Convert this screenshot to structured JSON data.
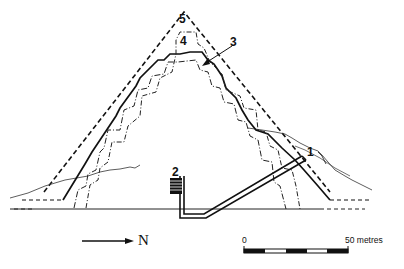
{
  "diagram": {
    "title": "",
    "labels": [
      {
        "id": "1",
        "text": "1",
        "x": 306,
        "y": 146
      },
      {
        "id": "2",
        "text": "2",
        "x": 170,
        "y": 166
      },
      {
        "id": "3",
        "text": "3",
        "x": 228,
        "y": 36
      },
      {
        "id": "4",
        "text": "4",
        "x": 180,
        "y": 35
      },
      {
        "id": "5",
        "text": "5",
        "x": 179,
        "y": 14
      }
    ],
    "north_arrow": {
      "label": "N"
    },
    "scale_bar": {
      "start_label": "0",
      "end_label": "50 metres"
    },
    "colors": {
      "ink": "#111111",
      "background": "#ffffff"
    }
  }
}
